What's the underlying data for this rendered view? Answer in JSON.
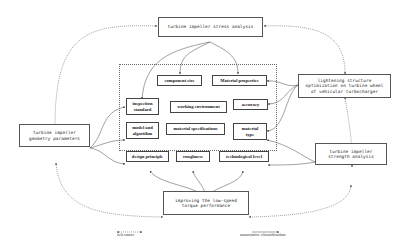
{
  "diagram": {
    "nodes": {
      "stress_analysis": "turbine impeller stress analysis",
      "lightening": "lightening structure optimization on turbine wheel of vehicular turbocharger",
      "lightening_lines": [
        "lightening structure",
        "optimization on turbine wheel",
        "of vehicular turbocharger"
      ],
      "geometry": "turbine impeller geometry parameters",
      "geometry_lines": [
        "turbine impeller",
        "geometry parameters"
      ],
      "strength": "turbine impeller strength analysis",
      "strength_lines": [
        "turbine impeller",
        "strength analysis"
      ],
      "torque": "improving the low-speed torque performance",
      "torque_lines": [
        "improving the low-speed",
        "torque performance"
      ]
    },
    "factors": {
      "component_size": "component size",
      "material_properties": "Material properties",
      "inspection_standard": [
        "inspection",
        "standard"
      ],
      "working_environment": "working environment",
      "accuracy": "accuracy",
      "model_algorithm": [
        "model and",
        "algorithm"
      ],
      "material_specifications": "material specifications",
      "material_type": [
        "material",
        "type"
      ],
      "design_principle": "design principle",
      "roughness": "roughness",
      "technological_level": "technological level"
    },
    "legend": {
      "relevance": "relevance",
      "associative": "associative classification"
    },
    "colors": {
      "line": "#444444",
      "border": "#555555",
      "background": "#ffffff"
    }
  }
}
